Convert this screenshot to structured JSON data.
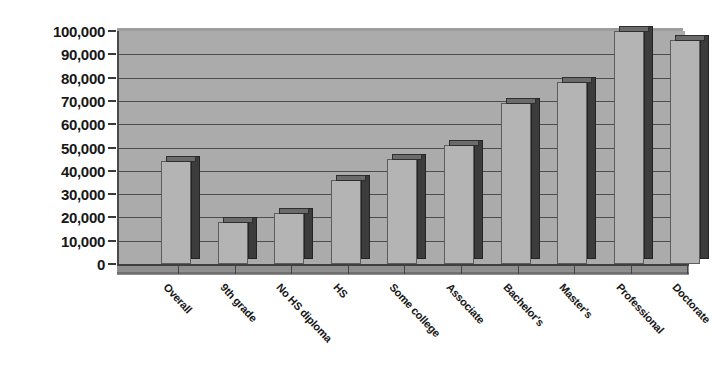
{
  "chart_data": {
    "type": "bar",
    "title": "",
    "subtitle": "",
    "xlabel": "",
    "ylabel": "",
    "ylim": [
      0,
      100000
    ],
    "ytick_step": 10000,
    "grid": true,
    "legend": "none",
    "style": "3d-column-grayscale",
    "categories": [
      "Overall",
      "9th grade",
      "No HS diploma",
      "HS",
      "Some college",
      "Associate",
      "Bachelor's",
      "Master's",
      "Professional",
      "Doctorate"
    ],
    "values": [
      44000,
      18000,
      22000,
      36000,
      45000,
      51000,
      69000,
      78000,
      100000,
      96000
    ],
    "ytick_labels": [
      "100,000",
      "90,000",
      "80,000",
      "70,000",
      "60,000",
      "50,000",
      "40,000",
      "30,000",
      "20,000",
      "10,000",
      "0"
    ],
    "ytick_values": [
      100000,
      90000,
      80000,
      70000,
      60000,
      50000,
      40000,
      30000,
      20000,
      10000,
      0
    ]
  },
  "colors": {
    "bar_face": "#b4b4b4",
    "bar_side": "#3c3c3c",
    "bar_top": "#6b6b6b",
    "plot_background": "#ababab",
    "gridline": "#4d4d4d",
    "axis_text": "#171717",
    "page_background": "#ffffff"
  }
}
